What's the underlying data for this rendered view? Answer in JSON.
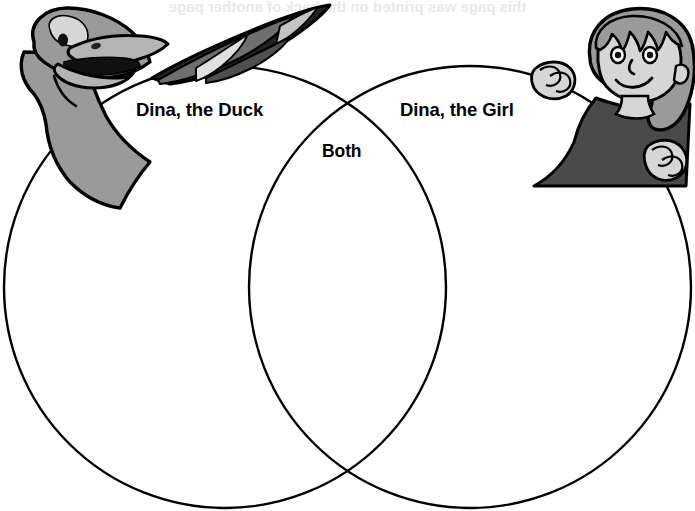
{
  "page": {
    "type": "venn-diagram-worksheet",
    "width": 695,
    "height": 511,
    "background_color": "#ffffff",
    "ink_color": "#000000"
  },
  "venn": {
    "left_circle": {
      "label": "Dina, the Duck",
      "cx": 225,
      "cy": 287,
      "r": 221
    },
    "right_circle": {
      "label": "Dina, the Girl",
      "cx": 470,
      "cy": 287,
      "r": 221
    },
    "overlap_label": "Both",
    "stroke_color": "#000000",
    "stroke_width": 2.4,
    "fill": "none"
  },
  "labels": {
    "left": "Dina, the Duck",
    "right": "Dina, the Girl",
    "center": "Both"
  },
  "illustrations": {
    "duck": {
      "name": "duck-illustration",
      "description": "Cartoon duck head with open beak and a banded wing draped over the left circle",
      "body_color": "#9a9a9a",
      "shadow_color": "#6f6f6f",
      "highlight_color": "#d0d0d0",
      "outline_color": "#000000"
    },
    "girl": {
      "name": "girl-illustration",
      "description": "Cartoon girl with bobbed hair peeking over the right circle, hands gripping the rim",
      "hair_color": "#9a9a9a",
      "skin_color": "#d6d6d6",
      "shirt_color": "#4a4a4a",
      "outline_color": "#000000"
    }
  },
  "bleed_text": {
    "top": "this page was printed on the back of another page",
    "body": "faint show-through text from the reverse side of the sheet"
  },
  "colors": {
    "ink": "#000000",
    "paper": "#ffffff",
    "gray_mid": "#9a9a9a",
    "gray_dark": "#6f6f6f",
    "gray_light": "#d0d0d0",
    "shirt": "#4a4a4a"
  }
}
